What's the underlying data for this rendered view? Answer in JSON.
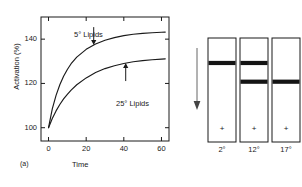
{
  "figure": {
    "panel_a_caption": "(a)",
    "panel_b_caption": "(b)"
  },
  "chart_data": {
    "type": "line",
    "title": "",
    "xlabel": "Time",
    "ylabel": "Activation (%)",
    "xlim": [
      -4,
      64
    ],
    "ylim": [
      94,
      150
    ],
    "xticks": [
      0,
      20,
      40,
      60
    ],
    "yticks": [
      100,
      120,
      140
    ],
    "xticklabels": [
      "0",
      "20",
      "40",
      "60"
    ],
    "yticklabels": [
      "100",
      "120",
      "140"
    ],
    "grid": false,
    "legend": "inline-annotations",
    "frame": "box",
    "series": [
      {
        "name": "5° Lipids",
        "annotation": "5° Lipids",
        "x": [
          0,
          2,
          4,
          6,
          8,
          10,
          12,
          15,
          20,
          25,
          30,
          35,
          40,
          45,
          50,
          55,
          60,
          62
        ],
        "y": [
          100.0,
          108.5,
          114.6,
          119.4,
          123.2,
          126.3,
          128.9,
          131.9,
          135.4,
          137.8,
          139.5,
          140.7,
          141.6,
          142.2,
          142.6,
          142.9,
          143.1,
          143.2
        ]
      },
      {
        "name": "25° Lipids",
        "annotation": "25° Lipids",
        "x": [
          0,
          2,
          4,
          6,
          8,
          10,
          12,
          15,
          20,
          25,
          30,
          35,
          40,
          45,
          50,
          55,
          60,
          62
        ],
        "y": [
          100.0,
          104.2,
          107.6,
          110.5,
          113.0,
          115.1,
          117.0,
          119.4,
          122.5,
          124.9,
          126.7,
          128.0,
          129.0,
          129.8,
          130.3,
          130.7,
          131.0,
          131.1
        ]
      }
    ]
  },
  "gel": {
    "migration_arrow": "down-arrow",
    "lanes": [
      {
        "label": "2°",
        "polarity": "+",
        "bands": [
          0.22
        ]
      },
      {
        "label": "12°",
        "polarity": "+",
        "bands": [
          0.22,
          0.4
        ]
      },
      {
        "label": "17°",
        "polarity": "+",
        "bands": [
          0.4
        ]
      }
    ]
  },
  "colors": {
    "ink": "#1a1a1a",
    "band": "#141414",
    "background": "#ffffff",
    "arrow": "#555555"
  }
}
